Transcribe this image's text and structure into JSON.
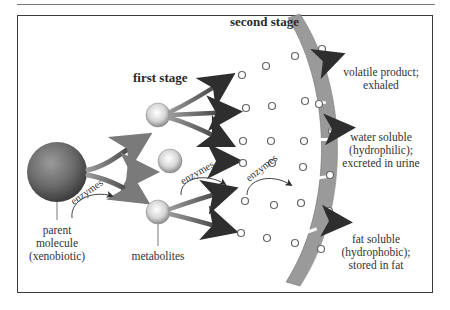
{
  "diagram": {
    "stages": {
      "first": "first stage",
      "second": "second stage"
    },
    "labels": {
      "parent": [
        "parent",
        "molecule",
        "(xenobiotic)"
      ],
      "metabolites": "metabolites",
      "enzymes": "enzymes"
    },
    "outcomes": {
      "volatile": [
        "volatile product;",
        "exhaled"
      ],
      "water": [
        "water soluble",
        "(hydrophilic);",
        "excreted in urine"
      ],
      "fat": [
        "fat soluble",
        "(hydrophobic);",
        "stored in fat"
      ]
    },
    "colors": {
      "parent_sphere": "#6e6e6e",
      "metabolite_sphere": "#d8d8d8",
      "arrow": "#3d3d3d",
      "membrane": "#9a9a9a",
      "frame": "#3a3a3a"
    }
  }
}
